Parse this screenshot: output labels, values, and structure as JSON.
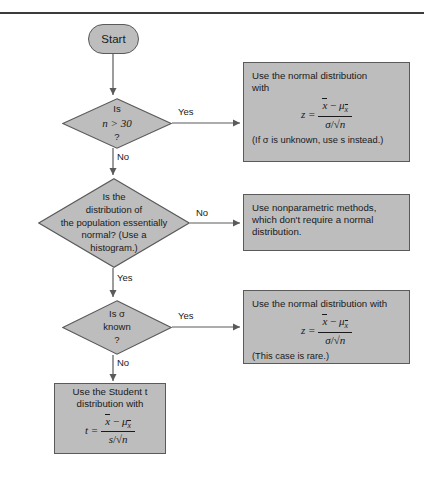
{
  "page": {
    "divider": "horizontal-rule",
    "background_color": "#ffffff",
    "node_fill": "#bdbdbd",
    "node_border": "#5a5a5a",
    "line_color": "#5a5a5a"
  },
  "flow": {
    "start": {
      "label": "Start"
    },
    "decisions": [
      {
        "id": "d1",
        "line1": "Is",
        "line2": "n > 30",
        "line3": "?"
      },
      {
        "id": "d2",
        "line1": "Is the",
        "line2": "distribution of",
        "line3": "the population essentially",
        "line4": "normal? (Use a",
        "line5": "histogram.)"
      },
      {
        "id": "d3",
        "line1": "Is σ",
        "line2": "known",
        "line3": "?"
      }
    ],
    "edge_labels": {
      "d1_yes": "Yes",
      "d1_no": "No",
      "d2_no": "No",
      "d2_yes": "Yes",
      "d3_yes": "Yes",
      "d3_no": "No"
    },
    "outcomes": [
      {
        "id": "o1",
        "text_line1": "Use the normal distribution",
        "text_line2": "with",
        "formula": {
          "lhs": "z =",
          "numerator_mean": "x",
          "numerator_minus": "−",
          "numerator_mu": "μ",
          "numerator_mu_sub": "x",
          "denominator_sd": "σ",
          "denominator_slash": "/",
          "denominator_root": "√n"
        },
        "note": "(If σ is unknown, use s instead.)"
      },
      {
        "id": "o2",
        "text_line1": "Use nonparametric methods,",
        "text_line2": "which don't require a normal",
        "text_line3": "distribution."
      },
      {
        "id": "o3",
        "text_line1": "Use the normal distribution with",
        "formula": {
          "lhs": "z =",
          "numerator_mean": "x",
          "numerator_minus": "−",
          "numerator_mu": "μ",
          "numerator_mu_sub": "x",
          "denominator_sd": "σ",
          "denominator_slash": "/",
          "denominator_root": "√n"
        },
        "note": "(This case is rare.)"
      },
      {
        "id": "o4",
        "text_line1": "Use the Student t",
        "text_line2": "distribution with",
        "formula": {
          "lhs": "t =",
          "numerator_mean": "x",
          "numerator_minus": "−",
          "numerator_mu": "μ",
          "numerator_mu_sub": "x",
          "denominator_sd": "s",
          "denominator_slash": "/",
          "denominator_root": "√n"
        }
      }
    ]
  }
}
